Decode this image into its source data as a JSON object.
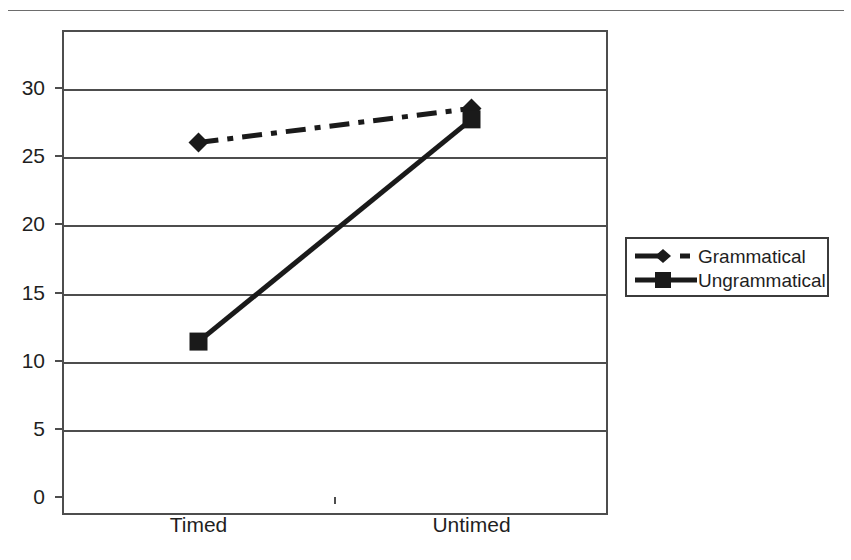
{
  "page": {
    "clipped_header_text": "",
    "background_color": "#ffffff",
    "line_color": "#1a1a1a"
  },
  "chart_data": {
    "type": "line",
    "title": "",
    "subtitle": "",
    "xlabel": "",
    "ylabel": "",
    "categories": [
      "Timed",
      "Untimed"
    ],
    "series": [
      {
        "name": "Grammatical",
        "values": [
          26.0,
          28.5
        ],
        "marker": "diamond",
        "linestyle": "dash-dot",
        "color": "#1a1a1a"
      },
      {
        "name": "Ungrammatical",
        "values": [
          11.4,
          27.7
        ],
        "marker": "square",
        "linestyle": "solid",
        "color": "#1a1a1a"
      }
    ],
    "ylim": [
      0,
      32.5
    ],
    "yticks": [
      0,
      5,
      10,
      15,
      20,
      25,
      30
    ],
    "ytick_labels": [
      "0",
      "5",
      "10",
      "15",
      "20",
      "25",
      "30"
    ],
    "grid": "horizontal",
    "legend_position": "right-outside",
    "legend_entries": [
      "Grammatical",
      "Ungrammatical"
    ]
  },
  "legend": {
    "rows": [
      {
        "label": "Grammatical",
        "marker": "diamond-marker-icon",
        "line": "dash-dot-line-icon"
      },
      {
        "label": "Ungrammatical",
        "marker": "square-marker-icon",
        "line": "solid-line-icon"
      }
    ]
  },
  "axes": {
    "y_labels": [
      "30",
      "25",
      "20",
      "15",
      "10",
      "5",
      "0"
    ],
    "x_labels": [
      "Timed",
      "Untimed"
    ]
  }
}
